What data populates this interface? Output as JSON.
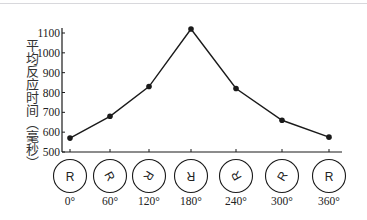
{
  "chart_data": {
    "type": "line",
    "title": "",
    "xlabel": "",
    "ylabel": "平均反应时间（毫秒）",
    "categories": [
      "0°",
      "60°",
      "120°",
      "180°",
      "240°",
      "300°",
      "360°"
    ],
    "x": [
      0,
      60,
      120,
      180,
      240,
      300,
      360
    ],
    "series": [
      {
        "name": "平均反应时间",
        "values": [
          570,
          680,
          830,
          1120,
          820,
          660,
          575
        ]
      }
    ],
    "ylim": [
      500,
      1100
    ],
    "yticks": [
      500,
      600,
      700,
      800,
      900,
      1000,
      1100
    ],
    "grid": false,
    "legend": "none",
    "markers": "filled-circle",
    "stimuli": {
      "letter": "R",
      "rotations_deg": [
        0,
        60,
        120,
        180,
        240,
        300,
        360
      ]
    }
  },
  "colors": {
    "line": "#1a1a1a",
    "axis": "#1a1a1a",
    "top_rule": "#d8d8dc",
    "background": "#ffffff"
  }
}
